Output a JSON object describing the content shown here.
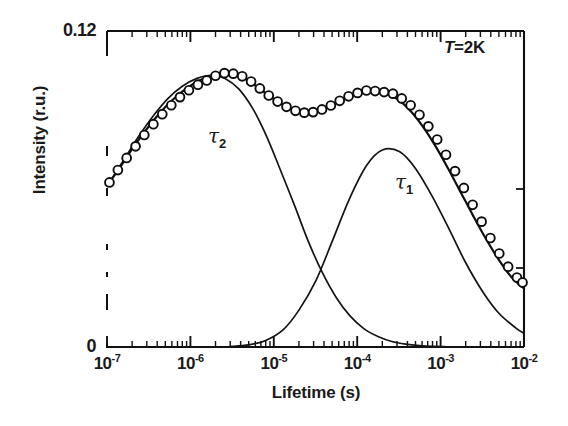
{
  "chart_data": {
    "type": "line",
    "title": "",
    "xlabel": "Lifetime (s)",
    "ylabel": "Intensity (r.u.)",
    "xscale": "log",
    "xlim": [
      1e-07,
      0.01
    ],
    "ylim": [
      0,
      0.12
    ],
    "xtick_labels": [
      "10",
      "10",
      "10",
      "10",
      "10",
      "10"
    ],
    "xtick_exponents": [
      "-7",
      "-6",
      "-5",
      "-4",
      "-3",
      "-2"
    ],
    "xtick_values": [
      1e-07,
      1e-06,
      1e-05,
      0.0001,
      0.001,
      0.01
    ],
    "ytick_labels": [
      "0.12",
      "0"
    ],
    "ytick_values": [
      0.12,
      0
    ],
    "grid": false,
    "legend": "none",
    "annotations": [
      {
        "name": "temperature",
        "text_italic": "T",
        "text_rest": "=2K",
        "x": 0.0045,
        "y": 0.114
      }
    ],
    "curve_labels": [
      {
        "name": "tau2",
        "symbol": "τ",
        "sub": "2",
        "x": 3.2e-06,
        "y": 0.0845
      },
      {
        "name": "tau1",
        "symbol": "τ",
        "sub": "1",
        "x": 0.00095,
        "y": 0.0665
      }
    ],
    "series": [
      {
        "name": "data points",
        "style": "open-circle markers",
        "x": [
          1.07e-07,
          1.35e-07,
          1.72e-07,
          2.2e-07,
          2.8e-07,
          3.6e-07,
          4.6e-07,
          5.9e-07,
          7.5e-07,
          9.6e-07,
          1.23e-06,
          1.57e-06,
          2e-06,
          2.56e-06,
          3.27e-06,
          4.18e-06,
          5.34e-06,
          6.8e-06,
          8.7e-06,
          1.11e-05,
          1.42e-05,
          1.82e-05,
          2.32e-05,
          2.96e-05,
          3.78e-05,
          4.83e-05,
          6.17e-05,
          7.88e-05,
          0.000101,
          0.000129,
          0.000164,
          0.00021,
          0.000268,
          0.000342,
          0.000437,
          0.000558,
          0.000713,
          0.00091,
          0.00116,
          0.00149,
          0.0019,
          0.00242,
          0.0031,
          0.00395,
          0.00505,
          0.00645,
          0.00823,
          0.0096
        ],
        "y": [
          0.0625,
          0.0672,
          0.0718,
          0.0762,
          0.0805,
          0.0846,
          0.0884,
          0.0918,
          0.0949,
          0.0975,
          0.0996,
          0.1012,
          0.103,
          0.104,
          0.1038,
          0.1028,
          0.1008,
          0.0982,
          0.0955,
          0.0932,
          0.0912,
          0.0897,
          0.089,
          0.0892,
          0.0902,
          0.0917,
          0.0935,
          0.0952,
          0.0965,
          0.0974,
          0.0972,
          0.0968,
          0.0962,
          0.0944,
          0.0918,
          0.0882,
          0.0838,
          0.0788,
          0.073,
          0.0668,
          0.0604,
          0.054,
          0.0476,
          0.0414,
          0.0355,
          0.0305,
          0.0264,
          0.0245
        ]
      },
      {
        "name": "total fit",
        "style": "solid line",
        "x": [
          1.07e-07,
          1.5e-07,
          2.1e-07,
          3e-07,
          4.2e-07,
          6e-07,
          8.5e-07,
          1.2e-06,
          1.7e-06,
          2.4e-06,
          3.4e-06,
          4.8e-06,
          6.8e-06,
          9.6e-06,
          1.36e-05,
          1.92e-05,
          2.72e-05,
          3.84e-05,
          5.44e-05,
          7.7e-05,
          0.000109,
          0.000154,
          0.000218,
          0.000308,
          0.000436,
          0.000616,
          0.000872,
          0.00123,
          0.00174,
          0.00246,
          0.00348,
          0.00493,
          0.00697,
          0.01
        ],
        "y": [
          0.0625,
          0.0692,
          0.0762,
          0.0828,
          0.0885,
          0.0936,
          0.0976,
          0.1007,
          0.1028,
          0.104,
          0.1035,
          0.1014,
          0.098,
          0.0945,
          0.0916,
          0.0897,
          0.0891,
          0.0902,
          0.0925,
          0.095,
          0.0968,
          0.0973,
          0.0966,
          0.094,
          0.0896,
          0.0836,
          0.0762,
          0.0678,
          0.0588,
          0.0498,
          0.0412,
          0.0334,
          0.0268,
          0.0222
        ]
      },
      {
        "name": "tau2 component",
        "style": "solid line",
        "x": [
          1.07e-07,
          1.6e-07,
          2.4e-07,
          3.6e-07,
          5.4e-07,
          8e-07,
          1.2e-06,
          1.8e-06,
          2.6e-06,
          3.8e-06,
          5.6e-06,
          8.2e-06,
          1.2e-05,
          1.8e-05,
          2.6e-05,
          3.8e-05,
          5.6e-05,
          8.2e-05,
          0.00012,
          0.00018,
          0.00026,
          0.00038,
          0.00056,
          0.00082,
          0.0012,
          0.0018
        ],
        "y": [
          0.0625,
          0.0712,
          0.08,
          0.0878,
          0.0944,
          0.099,
          0.102,
          0.1032,
          0.102,
          0.098,
          0.0905,
          0.08,
          0.0672,
          0.0532,
          0.04,
          0.0284,
          0.0188,
          0.0118,
          0.007,
          0.0039,
          0.0021,
          0.0011,
          0.0005,
          0.0002,
          0.0001,
          0.0
        ]
      },
      {
        "name": "tau1 component",
        "style": "solid line",
        "x": [
          3e-06,
          5e-06,
          8e-06,
          1.3e-05,
          2e-05,
          3.2e-05,
          5e-05,
          8e-05,
          0.00013,
          0.0002,
          0.00032,
          0.0005,
          0.0008,
          0.0013,
          0.002,
          0.0032,
          0.005,
          0.008,
          0.01
        ],
        "y": [
          0.0002,
          0.0008,
          0.0025,
          0.0066,
          0.014,
          0.0252,
          0.04,
          0.056,
          0.069,
          0.0748,
          0.0742,
          0.0678,
          0.057,
          0.044,
          0.032,
          0.021,
          0.0128,
          0.0072,
          0.0052
        ]
      }
    ]
  }
}
